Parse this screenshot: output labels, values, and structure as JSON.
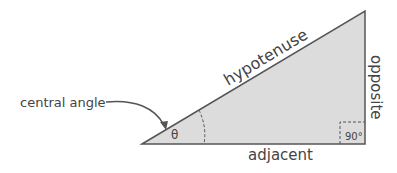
{
  "diagram": {
    "labels": {
      "hypotenuse": "hypotenuse",
      "opposite": "opposite",
      "adjacent": "adjacent",
      "central_angle": "central angle",
      "theta": "θ",
      "right_angle": "90°"
    },
    "colors": {
      "fill": "#dcdcdc",
      "stroke": "#555555",
      "text": "#444444"
    }
  }
}
